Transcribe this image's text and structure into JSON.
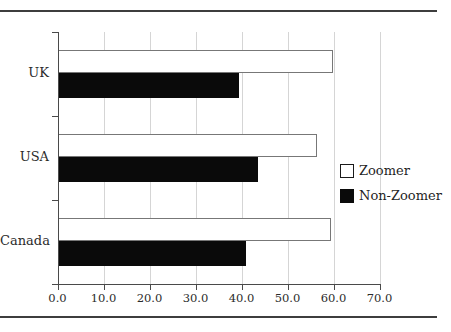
{
  "chart_data": {
    "type": "bar",
    "orientation": "horizontal",
    "title": "",
    "xlabel": "",
    "ylabel": "",
    "categories": [
      "UK",
      "USA",
      "Canada"
    ],
    "series": [
      {
        "name": "Zoomer",
        "color": "#ffffff",
        "values": [
          59.9,
          56.4,
          59.4
        ]
      },
      {
        "name": "Non-Zoomer",
        "color": "#0a0a0a",
        "values": [
          39.5,
          43.5,
          40.9
        ]
      }
    ],
    "xlim": [
      0,
      70
    ],
    "x_ticks": [
      "0.0",
      "10.0",
      "20.0",
      "30.0",
      "40.0",
      "50.0",
      "60.0",
      "70.0"
    ],
    "grid": "vertical",
    "legend_position": "right"
  },
  "colors": {
    "bar_fill_zoomer": "#ffffff",
    "bar_fill_non_zoomer": "#0a0a0a",
    "bar_border": "#777777",
    "gridline": "#d5d5d5",
    "axis": "#4a4a4a",
    "rule": "#3d3d3d",
    "text": "#2b2b2b"
  }
}
